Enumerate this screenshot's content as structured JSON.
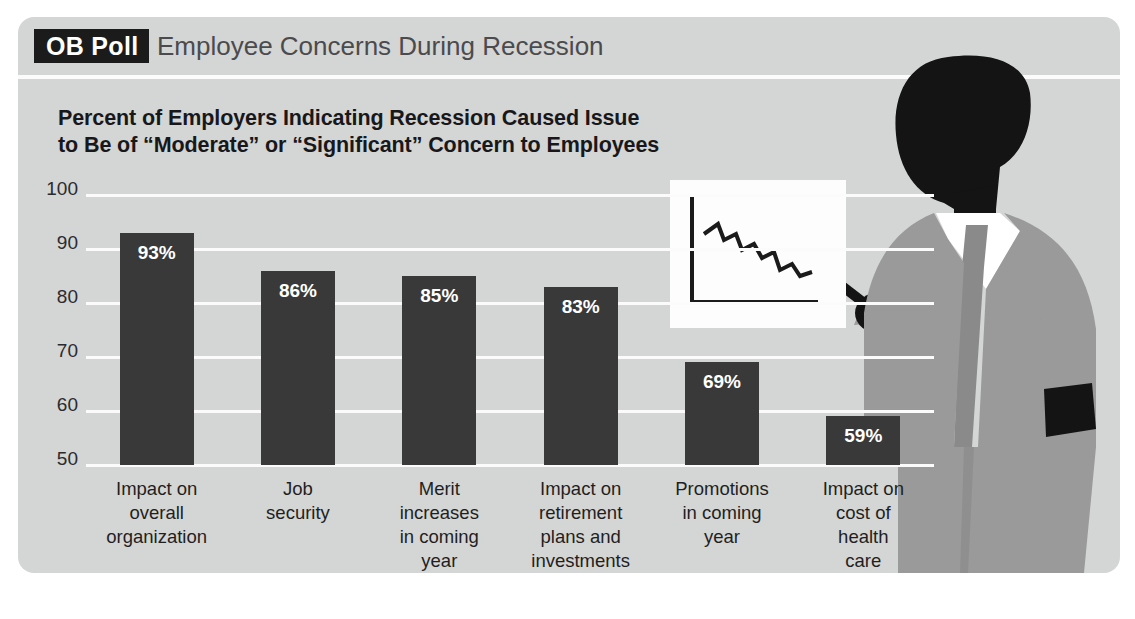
{
  "header": {
    "badge_label": "OB Poll",
    "title": "Employee Concerns During Recession"
  },
  "subtitle": {
    "line1": "Percent of Employers Indicating Recession Caused Issue",
    "line2": "to Be of “Moderate” or “Significant” Concern to Employees"
  },
  "colors": {
    "panel_background": "#d4d5d5",
    "bar": "#393939",
    "gridline": "#fbfbfb",
    "badge_background": "#1b1b1b",
    "title_text": "#4b4b4d",
    "suit": "#9a9a9a",
    "skin": "#141414",
    "shirt": "#ffffff",
    "tie": "#8a8a8a"
  },
  "illustration": {
    "figure_name": "businessman-presenter-silhouette",
    "board_name": "presentation-board",
    "board_chart": "declining-line-chart",
    "pointer_name": "pointer-stick"
  },
  "chart_data": {
    "type": "bar",
    "title": "Employee Concerns During Recession",
    "subtitle": "Percent of Employers Indicating Recession Caused Issue to Be of “Moderate” or “Significant” Concern to Employees",
    "xlabel": "",
    "ylabel": "",
    "ylim": [
      50,
      100
    ],
    "yticks": [
      100,
      90,
      80,
      70,
      60,
      50
    ],
    "ytick_labels": [
      "100",
      "90",
      "80",
      "70",
      "60",
      "50"
    ],
    "grid": true,
    "legend": false,
    "value_suffix": "%",
    "categories": [
      "Impact on overall organization",
      "Job security",
      "Merit increases in coming year",
      "Impact on retirement plans and investments",
      "Promotions in coming year",
      "Impact on cost of health care"
    ],
    "category_lines": [
      [
        "Impact on",
        "overall",
        "organization"
      ],
      [
        "Job",
        "security"
      ],
      [
        "Merit",
        "increases",
        "in coming",
        "year"
      ],
      [
        "Impact on",
        "retirement",
        "plans and",
        "investments"
      ],
      [
        "Promotions",
        "in coming",
        "year"
      ],
      [
        "Impact on",
        "cost of",
        "health",
        "care"
      ]
    ],
    "values": [
      93,
      86,
      85,
      83,
      69,
      59
    ],
    "value_labels": [
      "93%",
      "86%",
      "85%",
      "83%",
      "69%",
      "59%"
    ]
  }
}
